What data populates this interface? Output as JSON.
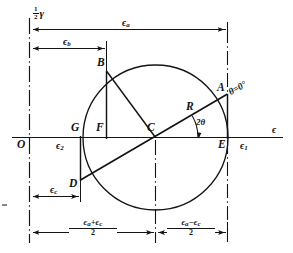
{
  "figure": {
    "type": "mohr-circle-strain-diagram",
    "axis_label_horizontal": "ϵ",
    "axis_label_vertical_numer": "1",
    "axis_label_vertical_denom": "2",
    "axis_label_vertical_symbol": "γ",
    "origin_label": "O"
  },
  "points": [
    {
      "name": "A",
      "label": "A",
      "x": 227,
      "y": 94,
      "note": "theta-zero point on circle"
    },
    {
      "name": "B",
      "label": "B",
      "x": 106,
      "y": 71,
      "note": "upper-left point on circle"
    },
    {
      "name": "C",
      "label": "C",
      "x": 155,
      "y": 137,
      "note": "circle center"
    },
    {
      "name": "D",
      "label": "D",
      "x": 80,
      "y": 180,
      "note": "lower-left point on circle"
    },
    {
      "name": "E",
      "label": "E",
      "x": 227,
      "y": 137,
      "note": "foot of A on epsilon axis"
    },
    {
      "name": "F",
      "label": "F",
      "x": 106,
      "y": 137,
      "note": "foot of B on epsilon axis"
    },
    {
      "name": "G",
      "label": "G",
      "x": 80,
      "y": 137,
      "note": "foot of D on epsilon axis"
    }
  ],
  "annotations": {
    "radius_label": "R",
    "angle_label": "2θ",
    "theta_zero_label": "θ=0°",
    "eps1_label": "ϵ",
    "eps1_sub": "1",
    "eps2_label": "ϵ",
    "eps2_sub": "2",
    "eps_axis_label": "ϵ"
  },
  "dimensions": [
    {
      "name": "eps-a",
      "symbol": "ϵ",
      "sub": "a",
      "from_x": 29,
      "to_x": 227,
      "y": 29
    },
    {
      "name": "eps-b",
      "symbol": "ϵ",
      "sub": "b",
      "from_x": 29,
      "to_x": 106,
      "y": 48
    },
    {
      "name": "eps-c",
      "symbol": "ϵ",
      "sub": "c",
      "from_x": 29,
      "to_x": 80,
      "y": 196
    }
  ],
  "bottom_dimensions": [
    {
      "name": "eps-a-plus-eps-c-over-2",
      "numerator": "ϵₐ+Ϸ",
      "numer_parts": [
        "ϵ",
        "a",
        "+",
        "ϵ",
        "c"
      ],
      "denominator": "2",
      "from_x": 29,
      "to_x": 155,
      "y": 232
    },
    {
      "name": "eps-a-minus-eps-c-over-2",
      "numer_parts": [
        "ϵ",
        "a",
        "−",
        "ϵ",
        "c"
      ],
      "denominator": "2",
      "from_x": 155,
      "to_x": 227,
      "y": 232
    }
  ],
  "colors": {
    "line": "#141414",
    "background": "#ffffff"
  }
}
